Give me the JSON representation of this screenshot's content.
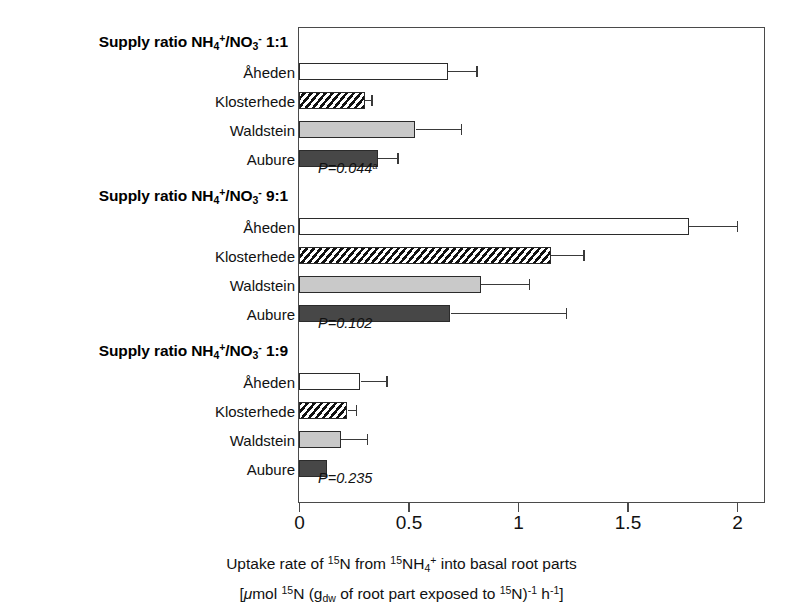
{
  "chart_data": {
    "type": "bar",
    "orientation": "horizontal",
    "title": "",
    "xlabel_line1": "Uptake rate of 15N from 15NH4+ into basal root parts",
    "xlabel_line2": "[μmol 15N (gdw of root part exposed to 15N)-1 h-1]",
    "xlim": [
      0,
      2
    ],
    "xticks": [
      0,
      0.5,
      1,
      1.5,
      2
    ],
    "xtick_labels": [
      "0",
      "0.5",
      "1",
      "1.5",
      "2"
    ],
    "grid": false,
    "legend": "none",
    "categories": [
      "Åheden",
      "Klosterhede",
      "Waldstein",
      "Aubure"
    ],
    "groups": [
      {
        "name": "Supply ratio NH4+/NO3- 1:1",
        "ratio": "1:1",
        "pvalue_text": "P=0.044",
        "pvalue_superscript": "a",
        "bars": [
          {
            "category": "Åheden",
            "value": 0.68,
            "error_high": 0.81,
            "fill": "open"
          },
          {
            "category": "Klosterhede",
            "value": 0.3,
            "error_high": 0.33,
            "fill": "hatch"
          },
          {
            "category": "Waldstein",
            "value": 0.53,
            "error_high": 0.74,
            "fill": "light-gray"
          },
          {
            "category": "Aubure",
            "value": 0.36,
            "error_high": 0.45,
            "fill": "dark-gray"
          }
        ]
      },
      {
        "name": "Supply ratio NH4+/NO3- 9:1",
        "ratio": "9:1",
        "pvalue_text": "P=0.102",
        "pvalue_superscript": "",
        "bars": [
          {
            "category": "Åheden",
            "value": 1.78,
            "error_high": 2.0,
            "fill": "open"
          },
          {
            "category": "Klosterhede",
            "value": 1.15,
            "error_high": 1.3,
            "fill": "hatch"
          },
          {
            "category": "Waldstein",
            "value": 0.83,
            "error_high": 1.05,
            "fill": "light-gray"
          },
          {
            "category": "Aubure",
            "value": 0.69,
            "error_high": 1.22,
            "fill": "dark-gray"
          }
        ]
      },
      {
        "name": "Supply ratio NH4+/NO3- 1:9",
        "ratio": "1:9",
        "pvalue_text": "P=0.235",
        "pvalue_superscript": "",
        "bars": [
          {
            "category": "Åheden",
            "value": 0.28,
            "error_high": 0.4,
            "fill": "open"
          },
          {
            "category": "Klosterhede",
            "value": 0.22,
            "error_high": 0.26,
            "fill": "hatch"
          },
          {
            "category": "Waldstein",
            "value": 0.19,
            "error_high": 0.31,
            "fill": "light-gray"
          },
          {
            "category": "Aubure",
            "value": 0.13,
            "error_high": null,
            "fill": "dark-gray"
          }
        ]
      }
    ],
    "colors": {
      "open": "#ffffff",
      "hatch": "#111111",
      "light_gray": "#c9c9c9",
      "dark_gray": "#474747",
      "axis": "#4a4a4a"
    }
  },
  "labels": {
    "supply_prefix": "Supply ratio NH",
    "nh4_sub": "4",
    "nh4_sup": "+",
    "slash_no": "/NO",
    "no3_sub": "3",
    "no3_sup": "-"
  },
  "axis_title": {
    "part1": "Uptake rate of ",
    "sup15a": "15",
    "n1": "N from ",
    "sup15b": "15",
    "nh": "NH",
    "nh_sub": "4",
    "nh_sup": "+",
    "tail1": " into basal root parts",
    "open_bracket": "[",
    "mu": "μ",
    "mol": "mol ",
    "sup15c": "15",
    "n2": "N (g",
    "dw": "dw",
    "mid": " of root part exposed to ",
    "sup15d": "15",
    "n3": "N)",
    "exp1": "-1",
    "hh": " h",
    "exp2": "-1",
    "close_bracket": "]"
  }
}
